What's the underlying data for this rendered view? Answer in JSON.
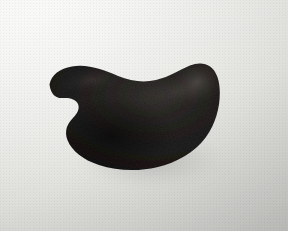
{
  "image": {
    "title": "Dark kidney-shaped object on light background",
    "width": 288,
    "height": 231,
    "medium": "photograph",
    "alt_text": "A large dark near-black bean or kidney shaped object resting on a pale off-white textured surface"
  },
  "background": {
    "name": "light-neutral-surface",
    "description": "Pale off-white paper-like surface with soft gradient",
    "color_top_left": "#f7f7f5",
    "color_center": "#eaeae7",
    "color_bottom_right": "#cdcdca",
    "texture": "fine-grain"
  },
  "object": {
    "name": "kidney-shaped-object",
    "label": "dark curved object",
    "fill_color": "#1a1816",
    "fill_color_core": "#0d0c0b",
    "rim_highlight_color": "#4a4642",
    "shadow_color": "#b9b9b5",
    "orientation": "horizontal",
    "silhouette_description": "Crescent or kidney outline: rounded left tip, shallow dip along the top edge, tall rounded right lobe, smooth convex bottom arc, and a deep concave notch cut into the lower-left side",
    "bounds": {
      "left": 48,
      "top": 63,
      "right": 220,
      "bottom": 170
    },
    "features": [
      {
        "name": "left-tip",
        "x": 49,
        "y": 83
      },
      {
        "name": "top-dip",
        "x": 122,
        "y": 79
      },
      {
        "name": "top-right-peak",
        "x": 200,
        "y": 65
      },
      {
        "name": "right-bulge",
        "x": 219,
        "y": 107
      },
      {
        "name": "bottom-low-point",
        "x": 146,
        "y": 169
      },
      {
        "name": "left-notch-cusp",
        "x": 63,
        "y": 101
      },
      {
        "name": "left-notch-inner",
        "x": 77,
        "y": 127
      }
    ]
  },
  "lighting": {
    "name": "soft-key-from-upper-left",
    "highlight_region": "upper-right rim of object",
    "shadow_region": "lower-right of object"
  }
}
